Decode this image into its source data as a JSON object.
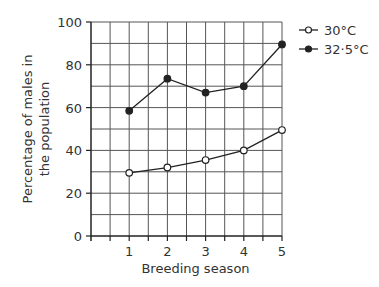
{
  "chart_data": {
    "type": "line",
    "title": "",
    "xlabel": "Breeding season",
    "ylabel_lines": [
      "Percentage of males in",
      "the population"
    ],
    "x": [
      1,
      2,
      3,
      4,
      5
    ],
    "x_tick_labels": [
      "1",
      "2",
      "3",
      "4",
      "5"
    ],
    "xlim": [
      0,
      5
    ],
    "ylim": [
      0,
      100
    ],
    "y_ticks": [
      0,
      20,
      40,
      60,
      80,
      100
    ],
    "y_tick_labels": [
      "0",
      "20",
      "40",
      "60",
      "80",
      "100"
    ],
    "grid": true,
    "legend_position": "top-right",
    "series": [
      {
        "name": "30°C",
        "marker": "open-circle",
        "values": [
          29.5,
          32,
          35.5,
          40,
          49.5
        ]
      },
      {
        "name": "32·5°C",
        "marker": "filled-circle",
        "values": [
          58.5,
          73.5,
          67,
          70,
          89.5
        ]
      }
    ]
  }
}
